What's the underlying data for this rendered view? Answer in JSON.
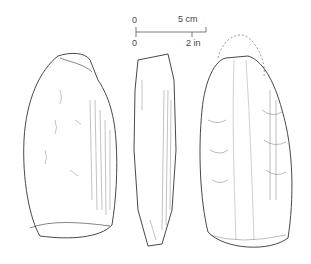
{
  "figure": {
    "views": [
      {
        "name": "front-face"
      },
      {
        "name": "side-profile"
      },
      {
        "name": "reverse-face"
      }
    ]
  },
  "scale_bar": {
    "metric_zero": "0",
    "metric_label": "5 cm",
    "imperial_zero": "0",
    "imperial_label": "2 in"
  },
  "colors": {
    "line": "#333333",
    "background": "#ffffff"
  }
}
